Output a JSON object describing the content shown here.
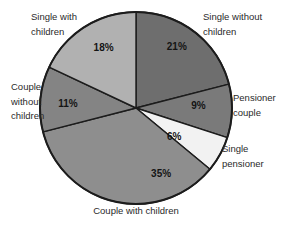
{
  "chart_data": {
    "type": "pie",
    "title": "",
    "start_angle_deg": 0,
    "direction": "clockwise",
    "outline_color": "#1c1c1c",
    "background": "#ffffff",
    "legend_position": "labels-around-pie",
    "categories": [
      "Single without children",
      "Pensioner couple",
      "Single pensioner",
      "Couple with children",
      "Couple without children",
      "Single with children"
    ],
    "values": [
      21,
      9,
      6,
      35,
      11,
      18
    ],
    "slices": [
      {
        "label": "Single without children",
        "value": 21,
        "pct_label": "21%",
        "color": "#6e6e6e",
        "label_angle": 33.5,
        "label_r": 0.77
      },
      {
        "label": "Pensioner couple",
        "value": 9,
        "pct_label": "9%",
        "color": "#7a7a7a",
        "label_angle": 88,
        "label_r": 0.65
      },
      {
        "label": "Single pensioner",
        "value": 6,
        "pct_label": "6%",
        "color": "#f2f2f2",
        "label_angle": 127,
        "label_r": 0.5
      },
      {
        "label": "Couple with children",
        "value": 35,
        "pct_label": "35%",
        "color": "#8e8e8e",
        "label_angle": 159,
        "label_r": 0.73
      },
      {
        "label": "Couple without children",
        "value": 11,
        "pct_label": "11%",
        "color": "#848484",
        "label_angle": 274,
        "label_r": 0.71
      },
      {
        "label": "Single with children",
        "value": 18,
        "pct_label": "18%",
        "color": "#b1b1b1",
        "label_angle": 332,
        "label_r": 0.72
      }
    ]
  }
}
